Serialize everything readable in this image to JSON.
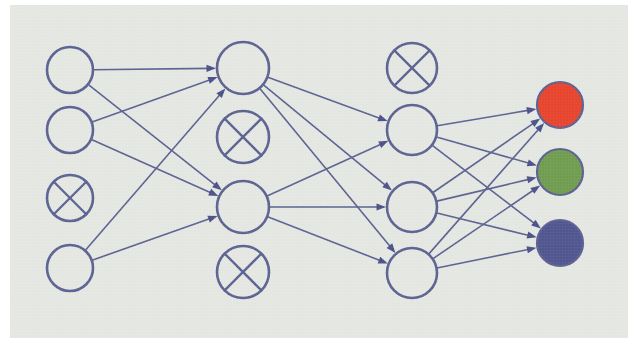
{
  "figure": {
    "type": "diagram",
    "background_color": "#ffffff",
    "panel_color": "#e6e8e3",
    "stroke_color": "#5a6191",
    "arrow_color": "#4a5088",
    "panel": {
      "x": 10,
      "y": 5,
      "width": 618,
      "height": 333
    }
  },
  "layers": [
    {
      "id": "input",
      "name": "input-layer",
      "x": 70,
      "node_radius": 23,
      "nodes": [
        {
          "id": "i1",
          "label": "",
          "cy": 70,
          "state": "active",
          "fill": "none"
        },
        {
          "id": "i2",
          "label": "",
          "cy": 130,
          "state": "active",
          "fill": "none"
        },
        {
          "id": "i3",
          "label": "",
          "cy": 198,
          "state": "dropped",
          "fill": "none"
        },
        {
          "id": "i4",
          "label": "",
          "cy": 268,
          "state": "active",
          "fill": "none"
        }
      ]
    },
    {
      "id": "hidden1",
      "name": "hidden-layer-1",
      "x": 243,
      "node_radius": 26,
      "nodes": [
        {
          "id": "h1a",
          "label": "",
          "cy": 68,
          "state": "active",
          "fill": "none"
        },
        {
          "id": "h1b",
          "label": "",
          "cy": 137,
          "state": "dropped",
          "fill": "none"
        },
        {
          "id": "h1c",
          "label": "",
          "cy": 207,
          "state": "active",
          "fill": "none"
        },
        {
          "id": "h1d",
          "label": "",
          "cy": 272,
          "state": "dropped",
          "fill": "none"
        }
      ]
    },
    {
      "id": "hidden2",
      "name": "hidden-layer-2",
      "x": 412,
      "node_radius": 25,
      "nodes": [
        {
          "id": "h2a",
          "label": "",
          "cy": 68,
          "state": "dropped",
          "fill": "none"
        },
        {
          "id": "h2b",
          "label": "",
          "cy": 130,
          "state": "active",
          "fill": "none"
        },
        {
          "id": "h2c",
          "label": "",
          "cy": 207,
          "state": "active",
          "fill": "none"
        },
        {
          "id": "h2d",
          "label": "",
          "cy": 273,
          "state": "active",
          "fill": "none"
        }
      ]
    },
    {
      "id": "output",
      "name": "output-layer",
      "x": 560,
      "node_radius": 23,
      "nodes": [
        {
          "id": "o1",
          "label": "",
          "cy": 105,
          "state": "active",
          "fill": "#e8422b"
        },
        {
          "id": "o2",
          "label": "",
          "cy": 172,
          "state": "active",
          "fill": "#6f9c4f"
        },
        {
          "id": "o3",
          "label": "",
          "cy": 243,
          "state": "active",
          "fill": "#4f548f"
        }
      ]
    }
  ],
  "edges": [
    {
      "from": "i1",
      "to": "h1a"
    },
    {
      "from": "i1",
      "to": "h1c"
    },
    {
      "from": "i2",
      "to": "h1a"
    },
    {
      "from": "i2",
      "to": "h1c"
    },
    {
      "from": "i4",
      "to": "h1a"
    },
    {
      "from": "i4",
      "to": "h1c"
    },
    {
      "from": "h1a",
      "to": "h2b"
    },
    {
      "from": "h1a",
      "to": "h2c"
    },
    {
      "from": "h1a",
      "to": "h2d"
    },
    {
      "from": "h1c",
      "to": "h2b"
    },
    {
      "from": "h1c",
      "to": "h2c"
    },
    {
      "from": "h1c",
      "to": "h2d"
    },
    {
      "from": "h2b",
      "to": "o1"
    },
    {
      "from": "h2b",
      "to": "o2"
    },
    {
      "from": "h2b",
      "to": "o3"
    },
    {
      "from": "h2c",
      "to": "o1"
    },
    {
      "from": "h2c",
      "to": "o2"
    },
    {
      "from": "h2c",
      "to": "o3"
    },
    {
      "from": "h2d",
      "to": "o1"
    },
    {
      "from": "h2d",
      "to": "o2"
    },
    {
      "from": "h2d",
      "to": "o3"
    }
  ],
  "legend": {
    "dropped_marker": "x-cross-icon",
    "dropped_meaning": "dropped unit",
    "active_meaning": "active unit"
  }
}
